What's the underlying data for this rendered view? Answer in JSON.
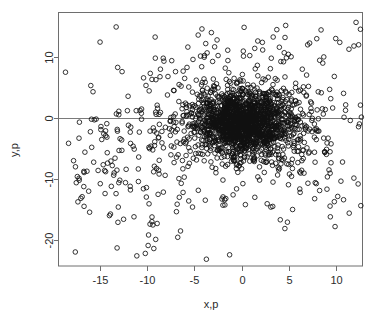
{
  "figure": {
    "name": "scatter-plot-xp-yp",
    "background": "#ffffff",
    "frame_color": "#6e6e6e",
    "point_color": "#111111"
  },
  "axes": {
    "x_title": "x,p",
    "y_title": "y,p",
    "x_ticks": [
      "-15",
      "-10",
      "-5",
      "0",
      "5",
      "10"
    ],
    "y_ticks": [
      "10",
      "0",
      "-10",
      "-20"
    ]
  },
  "chart_data": {
    "type": "scatter",
    "title": "",
    "subtitle": "",
    "xlabel": "x,p",
    "ylabel": "y,p",
    "xlim": [
      -18.5,
      12.9
    ],
    "ylim": [
      -24.6,
      16.0
    ],
    "xticks": [
      -15,
      -10,
      -5,
      0,
      5,
      10
    ],
    "yticks": [
      10,
      0,
      -10,
      -20
    ],
    "grid": false,
    "legend": null,
    "marker": "open-circle",
    "marker_size_px": 4.6,
    "annotations": [
      {
        "type": "hline",
        "y": 0,
        "color": "#7a7a7a",
        "label": ""
      }
    ],
    "n_points": 2100,
    "series": [
      {
        "name": "points",
        "core": {
          "n": 1500,
          "center": [
            0.3,
            -0.8
          ],
          "sigma": [
            2.6,
            2.6
          ],
          "description": "dense near-circular core, nearly solid black"
        },
        "halo": {
          "n": 430,
          "center": [
            0.0,
            -0.6
          ],
          "sigma": [
            5.2,
            5.0
          ],
          "description": "moderately dense surrounding halo of open circles"
        },
        "tails": {
          "n": 170,
          "description": "sparse heavy-tailed outliers, arcs reaching x=-18 and y=-23"
        },
        "named_outliers": [
          [
            -17.8,
            -7.0
          ],
          [
            -17.6,
            -8.0
          ],
          [
            -17.4,
            -9.6
          ],
          [
            -17.2,
            -10.2
          ],
          [
            -16.6,
            -5.6
          ],
          [
            -16.2,
            -12.0
          ],
          [
            -15.9,
            -0.2
          ],
          [
            -15.6,
            -0.3
          ],
          [
            -15.2,
            -8.6
          ],
          [
            -14.9,
            -1.4
          ],
          [
            -14.6,
            -2.6
          ],
          [
            -14.4,
            -2.9
          ],
          [
            -14.2,
            -7.4
          ],
          [
            -14.0,
            -16.0
          ],
          [
            -13.7,
            -7.8
          ],
          [
            -13.5,
            -9.0
          ],
          [
            -13.3,
            -12.4
          ],
          [
            -13.1,
            -17.1
          ],
          [
            -12.9,
            -10.2
          ],
          [
            -12.7,
            -3.6
          ],
          [
            -12.5,
            -16.6
          ],
          [
            -12.3,
            -10.6
          ],
          [
            -12.1,
            1.2
          ],
          [
            -11.8,
            -11.2
          ],
          [
            -11.4,
            -16.2
          ],
          [
            -11.1,
            -22.6
          ],
          [
            -10.9,
            -6.4
          ],
          [
            -10.6,
            -0.2
          ],
          [
            -10.4,
            -11.6
          ],
          [
            -10.2,
            -22.2
          ],
          [
            -9.9,
            -20.9
          ],
          [
            -9.7,
            -17.4
          ],
          [
            -9.5,
            -17.0
          ],
          [
            -9.3,
            -21.4
          ],
          [
            -9.1,
            -19.9
          ],
          [
            -8.9,
            1.6
          ],
          [
            -8.6,
            8.0
          ],
          [
            -8.3,
            9.8
          ],
          [
            -8.1,
            -9.4
          ],
          [
            -7.8,
            6.8
          ],
          [
            -7.4,
            9.4
          ],
          [
            -7.0,
            7.6
          ],
          [
            -6.6,
            -13.0
          ],
          [
            -6.2,
            -12.2
          ],
          [
            -5.6,
            -13.6
          ],
          [
            -5.2,
            -14.6
          ],
          [
            -4.6,
            13.6
          ],
          [
            -4.2,
            14.6
          ],
          [
            -3.8,
            12.2
          ],
          [
            -3.2,
            14.0
          ],
          [
            -2.6,
            12.8
          ],
          [
            -1.8,
            -13.4
          ],
          [
            -0.9,
            -12.6
          ],
          [
            0.4,
            -14.2
          ],
          [
            1.4,
            -13.0
          ],
          [
            2.2,
            12.4
          ],
          [
            3.1,
            -14.6
          ],
          [
            4.0,
            11.6
          ],
          [
            4.6,
            13.2
          ],
          [
            5.4,
            -15.0
          ],
          [
            6.2,
            -12.2
          ],
          [
            7.0,
            12.0
          ],
          [
            7.8,
            -10.6
          ],
          [
            8.6,
            9.0
          ],
          [
            9.4,
            -16.2
          ],
          [
            9.9,
            -17.8
          ],
          [
            10.4,
            12.4
          ],
          [
            10.8,
            -13.4
          ],
          [
            11.4,
            -15.6
          ],
          [
            11.9,
            11.8
          ],
          [
            12.4,
            12.0
          ]
        ]
      }
    ]
  }
}
